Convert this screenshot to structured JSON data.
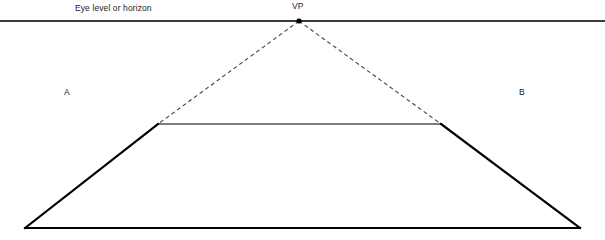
{
  "diagram": {
    "background_color": "#ffffff",
    "labels": {
      "horizon": "Eye level or horizon",
      "vanishing_point": "VP",
      "left_plane": "A",
      "right_plane": "B"
    },
    "colors": {
      "horizon_line": "#3a3a3a",
      "shape_outline": "#000000",
      "dashed_guide": "#444444",
      "text": "#1a1a1a",
      "vp_marker": "#000000"
    },
    "geometry": {
      "canvas": {
        "width": 605,
        "height": 240
      },
      "horizon_line": {
        "x1": 0,
        "y1": 21,
        "x2": 605,
        "y2": 21,
        "stroke_width": 1.4
      },
      "vanishing_point": {
        "x": 299,
        "y": 21,
        "marker_radius": 2.6
      },
      "top_edge": {
        "x1": 158,
        "y1": 124,
        "x2": 441,
        "y2": 124,
        "stroke_width": 1.2
      },
      "bottom_edge": {
        "x1": 25,
        "y1": 228,
        "x2": 580,
        "y2": 228,
        "stroke_width": 2
      },
      "left_edge": {
        "x1": 25,
        "y1": 228,
        "x2": 158,
        "y2": 124,
        "stroke_width": 2.2
      },
      "right_edge": {
        "x1": 441,
        "y1": 124,
        "x2": 580,
        "y2": 228,
        "stroke_width": 2.2
      },
      "guide_left": {
        "x1": 299,
        "y1": 21,
        "x2": 158,
        "y2": 124,
        "stroke_width": 1.1,
        "dash": "4 3"
      },
      "guide_right": {
        "x1": 299,
        "y1": 21,
        "x2": 441,
        "y2": 124,
        "stroke_width": 1.1,
        "dash": "4 3"
      },
      "label_positions": {
        "horizon": {
          "x": 75,
          "y": 4
        },
        "vanishing_point": {
          "x": 292,
          "y": 2
        },
        "left_plane": {
          "x": 64,
          "y": 88
        },
        "right_plane": {
          "x": 519,
          "y": 88
        }
      }
    }
  }
}
